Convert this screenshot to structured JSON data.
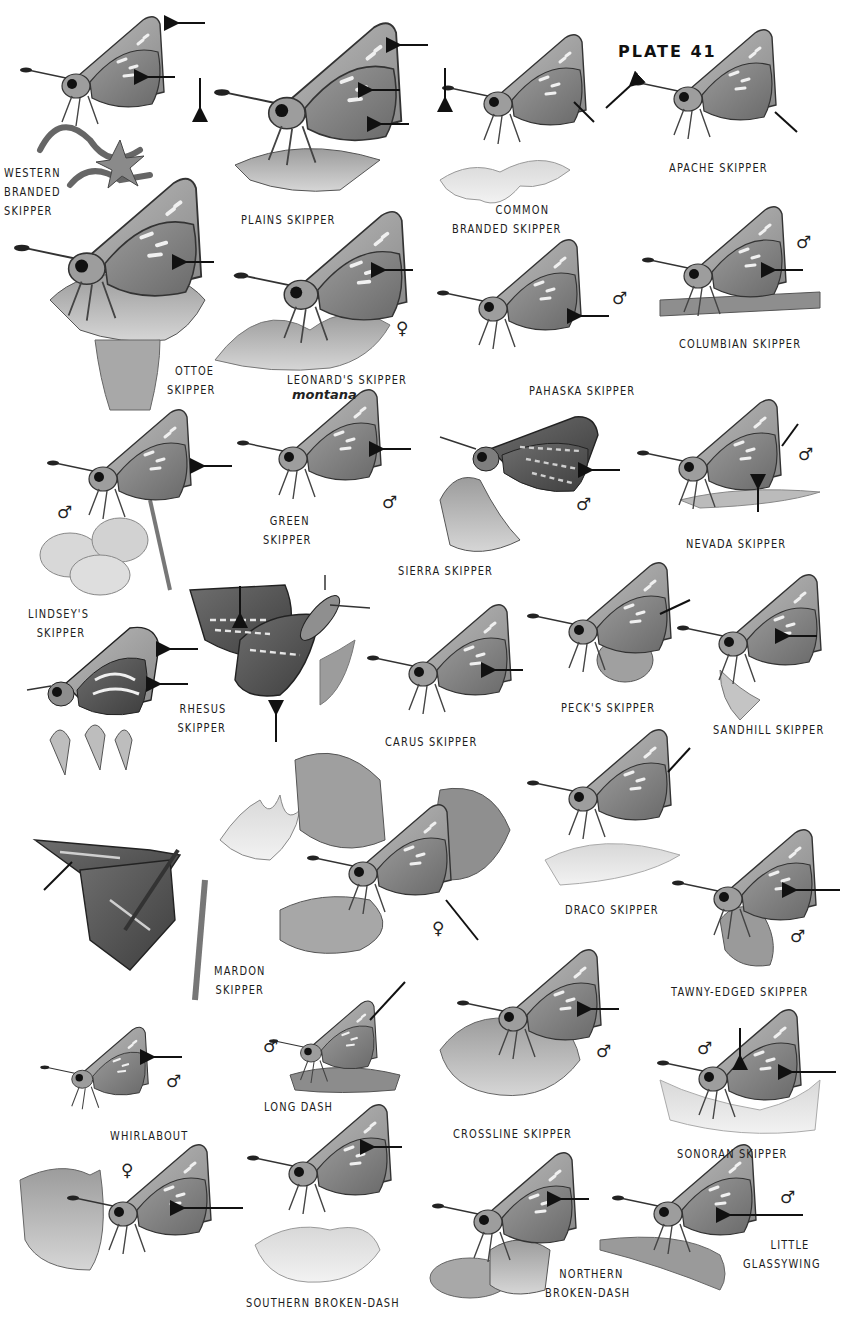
{
  "plate": {
    "title": "PLATE 41",
    "background": "#ffffff",
    "ink_color": "#1c1c1c"
  },
  "species": [
    {
      "id": "western-branded",
      "lines": [
        "WESTERN",
        "BRANDED",
        "SKIPPER"
      ],
      "sex": "",
      "arrows": 2
    },
    {
      "id": "plains",
      "lines": [
        "PLAINS SKIPPER"
      ],
      "sex": "",
      "arrows": 4
    },
    {
      "id": "common-branded",
      "lines": [
        "COMMON",
        "BRANDED SKIPPER"
      ],
      "sex": "",
      "arrows": 2
    },
    {
      "id": "apache",
      "lines": [
        "APACHE SKIPPER"
      ],
      "sex": "",
      "arrows": 2
    },
    {
      "id": "ottoe",
      "lines": [
        "OTTOE",
        "SKIPPER"
      ],
      "sex": "",
      "arrows": 1
    },
    {
      "id": "leonards",
      "lines": [
        "LEONARD'S SKIPPER"
      ],
      "subspecies": "montana",
      "sex": "♀",
      "arrows": 1
    },
    {
      "id": "pahaska",
      "lines": [
        "PAHASKA SKIPPER"
      ],
      "sex": "♂",
      "arrows": 1
    },
    {
      "id": "columbian",
      "lines": [
        "COLUMBIAN SKIPPER"
      ],
      "sex": "♂",
      "arrows": 1
    },
    {
      "id": "lindseys",
      "lines": [
        "LINDSEY'S",
        "SKIPPER"
      ],
      "sex": "♂",
      "arrows": 1
    },
    {
      "id": "green",
      "lines": [
        "GREEN",
        "SKIPPER"
      ],
      "sex": "♂",
      "arrows": 1
    },
    {
      "id": "sierra",
      "lines": [
        "SIERRA SKIPPER"
      ],
      "sex": "♂",
      "arrows": 1
    },
    {
      "id": "nevada",
      "lines": [
        "NEVADA SKIPPER"
      ],
      "sex": "♂",
      "arrows": 2
    },
    {
      "id": "rhesus",
      "lines": [
        "RHESUS",
        "SKIPPER"
      ],
      "sex": "",
      "arrows": 2
    },
    {
      "id": "rhesus-underside",
      "lines": [],
      "sex": "",
      "arrows": 2
    },
    {
      "id": "carus",
      "lines": [
        "CARUS SKIPPER"
      ],
      "sex": "",
      "arrows": 1
    },
    {
      "id": "pecks",
      "lines": [
        "PECK'S SKIPPER"
      ],
      "sex": "",
      "arrows": 1
    },
    {
      "id": "sandhill",
      "lines": [
        "SANDHILL SKIPPER"
      ],
      "sex": "",
      "arrows": 1
    },
    {
      "id": "draco",
      "lines": [
        "DRACO SKIPPER"
      ],
      "sex": "",
      "arrows": 1
    },
    {
      "id": "mardon",
      "lines": [
        "MARDON",
        "SKIPPER"
      ],
      "sex": "♀",
      "arrows": 2
    },
    {
      "id": "tawny-edged",
      "lines": [
        "TAWNY-EDGED SKIPPER"
      ],
      "sex": "♂",
      "arrows": 1
    },
    {
      "id": "whirlabout",
      "lines": [
        "WHIRLABOUT"
      ],
      "sex": "♂",
      "arrows": 1
    },
    {
      "id": "long-dash",
      "lines": [
        "LONG DASH"
      ],
      "sex": "♂",
      "arrows": 1
    },
    {
      "id": "crossline",
      "lines": [
        "CROSSLINE SKIPPER"
      ],
      "sex": "♂",
      "arrows": 1
    },
    {
      "id": "sonoran",
      "lines": [
        "SONORAN SKIPPER"
      ],
      "sex": "♂",
      "arrows": 2
    },
    {
      "id": "southern-broken-dash",
      "lines": [
        "SOUTHERN BROKEN-DASH"
      ],
      "sex": "♀",
      "arrows": 2
    },
    {
      "id": "northern-broken-dash",
      "lines": [
        "NORTHERN",
        "BROKEN-DASH"
      ],
      "sex": "",
      "arrows": 1
    },
    {
      "id": "little-glassywing",
      "lines": [
        "LITTLE",
        "GLASSYWING"
      ],
      "sex": "♂",
      "arrows": 1
    }
  ],
  "symbols": {
    "male": "♂",
    "female": "♀"
  }
}
